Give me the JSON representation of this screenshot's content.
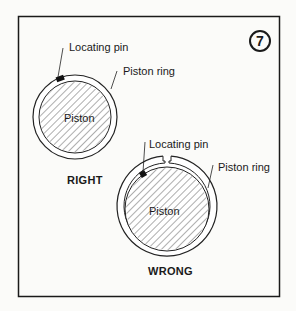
{
  "figure_number": "7",
  "right_diagram": {
    "caption": "RIGHT",
    "labels": {
      "pin": "Locating pin",
      "ring": "Piston ring",
      "piston": "Piston"
    }
  },
  "wrong_diagram": {
    "caption": "WRONG",
    "labels": {
      "pin": "Locating pin",
      "ring": "Piston ring",
      "piston": "Piston"
    }
  }
}
